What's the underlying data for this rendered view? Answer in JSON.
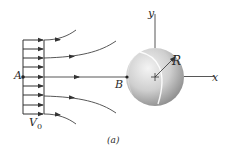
{
  "figure": {
    "caption": "(a)",
    "labels": {
      "point_a": "A",
      "point_b": "B",
      "radius": "R",
      "x_axis": "x",
      "y_axis": "y",
      "velocity": "V",
      "velocity_sub": "0"
    },
    "velocity_profile": {
      "arrow_count": 9,
      "description": "uniform velocity profile"
    },
    "colors": {
      "line": "#333333",
      "sphere_light": "#f2f2f2",
      "sphere_dark": "#8a8a8a",
      "seam": "#ffffff"
    }
  }
}
